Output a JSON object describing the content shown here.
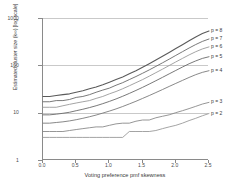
{
  "chart_data": {
    "type": "line",
    "title": "",
    "xlabel": "Voting preference  pmf skewness",
    "ylabel": "Estimated cluster size (k∞) [log scale]",
    "xlim": [
      0.0,
      2.5
    ],
    "ylim": [
      1,
      1000
    ],
    "yscale": "log",
    "grid": true,
    "legend_position": "right",
    "xticks": [
      "0.0",
      "0.5",
      "1.0",
      "1.5",
      "2.0",
      "2.5"
    ],
    "xtick_values": [
      0.0,
      0.5,
      1.0,
      1.5,
      2.0,
      2.5
    ],
    "yticks": [
      "1",
      "10",
      "100",
      "1000"
    ],
    "ytick_values": [
      1,
      10,
      100,
      1000
    ],
    "x": [
      0.0,
      0.1,
      0.2,
      0.3,
      0.4,
      0.5,
      0.6,
      0.7,
      0.8,
      0.9,
      1.0,
      1.1,
      1.2,
      1.3,
      1.4,
      1.5,
      1.6,
      1.7,
      1.8,
      1.9,
      2.0,
      2.1,
      2.2,
      2.3,
      2.4,
      2.5
    ],
    "series": [
      {
        "name": "p = 8",
        "label": "p = 8",
        "color": "#5a5a5a",
        "values": [
          22,
          22,
          23,
          24,
          25,
          27,
          29,
          32,
          35,
          39,
          44,
          50,
          57,
          66,
          77,
          91,
          108,
          129,
          155,
          187,
          226,
          273,
          330,
          398,
          468,
          530
        ]
      },
      {
        "name": "p = 7",
        "label": "p = 7",
        "color": "#6a6a6a",
        "values": [
          17,
          17,
          18,
          18,
          19,
          21,
          22,
          24,
          27,
          30,
          33,
          38,
          43,
          50,
          58,
          68,
          80,
          95,
          113,
          135,
          162,
          194,
          232,
          275,
          320,
          360
        ]
      },
      {
        "name": "p = 6",
        "label": "p = 6",
        "color": "#9a9a9a",
        "values": [
          13,
          13,
          13,
          14,
          15,
          16,
          17,
          18,
          20,
          22,
          25,
          28,
          32,
          37,
          43,
          50,
          59,
          70,
          83,
          99,
          118,
          140,
          166,
          194,
          222,
          245
        ]
      },
      {
        "name": "p = 5",
        "label": "p = 5",
        "color": "#6a6a6a",
        "values": [
          9.0,
          9.0,
          9.3,
          9.7,
          10.2,
          11.0,
          11.8,
          12.8,
          14.0,
          15.5,
          17.3,
          19.5,
          22.2,
          25.5,
          29.5,
          34.3,
          40.2,
          47.3,
          55.8,
          66.0,
          78.0,
          92.0,
          108,
          124,
          140,
          152
        ]
      },
      {
        "name": "p = 4",
        "label": "p = 4",
        "color": "#7a7a7a",
        "values": [
          6.0,
          6.0,
          6.2,
          6.4,
          6.7,
          7.1,
          7.6,
          8.2,
          8.9,
          9.8,
          10.8,
          12.0,
          13.5,
          15.3,
          17.4,
          20.0,
          23.0,
          26.6,
          30.8,
          35.8,
          41.5,
          48.0,
          55.5,
          63.5,
          71.0,
          77.0
        ]
      },
      {
        "name": "p = 3",
        "label": "p = 3",
        "color": "#8a8a8a",
        "values": [
          4.0,
          4.0,
          4.0,
          4.0,
          4.2,
          4.4,
          4.6,
          4.8,
          5.0,
          5.0,
          5.4,
          5.8,
          6.0,
          6.0,
          6.6,
          7.0,
          7.0,
          7.8,
          8.4,
          9.0,
          10.0,
          11.0,
          12.2,
          13.6,
          15.2,
          16.5
        ]
      },
      {
        "name": "p = 2",
        "label": "p = 2",
        "color": "#9a9a9a",
        "values": [
          3.0,
          3.0,
          3.0,
          3.0,
          3.0,
          3.0,
          3.0,
          3.0,
          3.0,
          3.0,
          3.0,
          3.0,
          3.0,
          4.0,
          4.0,
          4.0,
          4.0,
          4.2,
          4.6,
          5.0,
          5.4,
          6.0,
          6.8,
          7.6,
          8.6,
          9.6
        ]
      }
    ]
  }
}
